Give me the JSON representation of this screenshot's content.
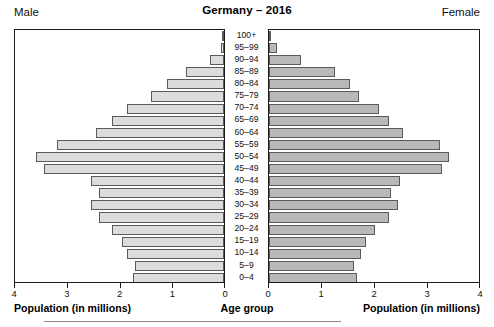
{
  "header": {
    "title": "Germany – 2016",
    "male_label": "Male",
    "female_label": "Female"
  },
  "axis": {
    "center_caption": "Age group",
    "male_caption": "Population (in millions)",
    "female_caption": "Population (in millions)",
    "male_ticks": [
      "4",
      "3",
      "2",
      "1",
      "0"
    ],
    "female_ticks": [
      "0",
      "1",
      "2",
      "3",
      "4"
    ]
  },
  "colors": {
    "male_bar": "#dcdcdc",
    "female_bar": "#b9b9b9",
    "bar_border": "#5a5a5a",
    "panel_border": "#1a1a1a",
    "text": "#111111"
  },
  "chart_data": {
    "type": "bar",
    "title": "Germany – 2016",
    "subtitle": "",
    "xlabel": "Population (in millions)",
    "ylabel": "Age group",
    "xlim": [
      0,
      4
    ],
    "grid": false,
    "legend_position": "none",
    "orientation": "horizontal",
    "layout": "population-pyramid",
    "categories": [
      "100+",
      "95–99",
      "90–94",
      "85–89",
      "80–84",
      "75–79",
      "70–74",
      "65–69",
      "60–64",
      "55–59",
      "50–54",
      "45–49",
      "40–44",
      "35–39",
      "30–34",
      "25–29",
      "20–24",
      "15–19",
      "10–14",
      "5–9",
      "0–4"
    ],
    "series": [
      {
        "name": "Male",
        "side": "left",
        "values": [
          0.01,
          0.06,
          0.26,
          0.72,
          1.1,
          1.4,
          1.85,
          2.15,
          2.45,
          3.2,
          3.6,
          3.45,
          2.55,
          2.4,
          2.55,
          2.4,
          2.15,
          1.95,
          1.85,
          1.7,
          1.75
        ]
      },
      {
        "name": "Female",
        "side": "right",
        "values": [
          0.04,
          0.16,
          0.6,
          1.26,
          1.55,
          1.72,
          2.1,
          2.28,
          2.55,
          3.25,
          3.42,
          3.3,
          2.5,
          2.32,
          2.45,
          2.28,
          2.02,
          1.85,
          1.75,
          1.62,
          1.68
        ]
      }
    ]
  }
}
